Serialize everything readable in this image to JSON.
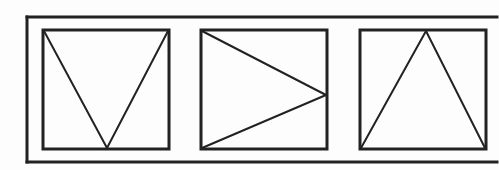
{
  "diagram": {
    "stroke_color": "#222222",
    "background": "#fdfdfd",
    "outer_frame": {
      "x1": 27,
      "y1": 17,
      "x2": 497,
      "y2": 162,
      "right_edge_visible": false
    },
    "panels": [
      {
        "id": "panel-1",
        "box": {
          "x": 43,
          "y": 30,
          "w": 126,
          "h": 119
        },
        "triangle_apex": "bottom-center",
        "lines": [
          {
            "x1": 44,
            "y1": 31,
            "x2": 107,
            "y2": 148
          },
          {
            "x1": 168,
            "y1": 31,
            "x2": 107,
            "y2": 148
          }
        ]
      },
      {
        "id": "panel-2",
        "box": {
          "x": 201,
          "y": 30,
          "w": 126,
          "h": 119
        },
        "triangle_apex": "right-middle",
        "lines": [
          {
            "x1": 202,
            "y1": 31,
            "x2": 326,
            "y2": 95
          },
          {
            "x1": 202,
            "y1": 148,
            "x2": 326,
            "y2": 95
          }
        ]
      },
      {
        "id": "panel-3",
        "box": {
          "x": 360,
          "y": 30,
          "w": 126,
          "h": 119
        },
        "triangle_apex": "top-center",
        "lines": [
          {
            "x1": 361,
            "y1": 148,
            "x2": 426,
            "y2": 31
          },
          {
            "x1": 485,
            "y1": 148,
            "x2": 426,
            "y2": 31
          }
        ]
      }
    ]
  }
}
